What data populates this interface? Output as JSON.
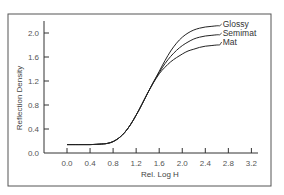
{
  "chart_data": {
    "type": "line",
    "title": "",
    "xlabel": "Rel. Log H",
    "ylabel": "Reflection Density",
    "xlim": [
      0.0,
      3.2
    ],
    "ylim": [
      0.0,
      2.0
    ],
    "xticks": [
      "0.0",
      "0.4",
      "0.8",
      "1.2",
      "1.6",
      "2.0",
      "2.4",
      "2.8",
      "3.2"
    ],
    "yticks": [
      "0.0",
      "0.4",
      "0.8",
      "1.2",
      "1.6",
      "2.0"
    ],
    "grid": false,
    "legend_position": "inline-right",
    "x": [
      0.0,
      0.2,
      0.4,
      0.6,
      0.7,
      0.8,
      0.9,
      1.0,
      1.1,
      1.2,
      1.3,
      1.4,
      1.5,
      1.6,
      1.7,
      1.8,
      1.9,
      2.0,
      2.1,
      2.2,
      2.3,
      2.4,
      2.5,
      2.6,
      2.65
    ],
    "series": [
      {
        "name": "Glossy",
        "values": [
          0.14,
          0.14,
          0.14,
          0.15,
          0.16,
          0.19,
          0.25,
          0.34,
          0.47,
          0.63,
          0.81,
          1.0,
          1.18,
          1.36,
          1.54,
          1.7,
          1.83,
          1.93,
          2.0,
          2.05,
          2.08,
          2.1,
          2.11,
          2.12,
          2.12
        ]
      },
      {
        "name": "Semimat",
        "values": [
          0.14,
          0.14,
          0.14,
          0.15,
          0.16,
          0.19,
          0.25,
          0.34,
          0.47,
          0.63,
          0.81,
          1.0,
          1.18,
          1.34,
          1.49,
          1.61,
          1.71,
          1.79,
          1.85,
          1.9,
          1.93,
          1.95,
          1.96,
          1.97,
          1.97
        ]
      },
      {
        "name": "Mat",
        "values": [
          0.14,
          0.14,
          0.14,
          0.15,
          0.16,
          0.19,
          0.25,
          0.34,
          0.47,
          0.63,
          0.81,
          1.0,
          1.17,
          1.32,
          1.43,
          1.52,
          1.59,
          1.65,
          1.7,
          1.73,
          1.76,
          1.78,
          1.79,
          1.8,
          1.8
        ]
      }
    ]
  }
}
